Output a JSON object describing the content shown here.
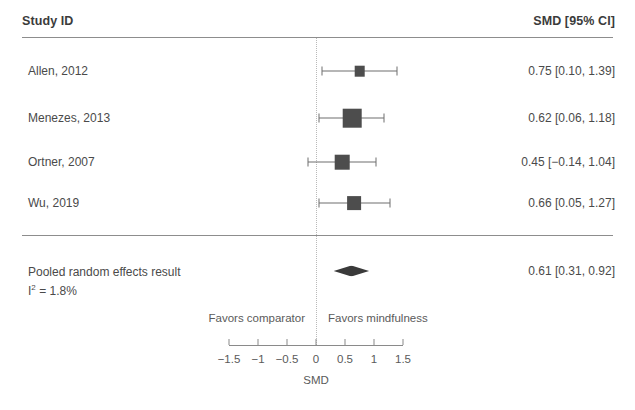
{
  "header": {
    "study_col": "Study ID",
    "effect_col": "SMD [95% CI]"
  },
  "chart_data": {
    "type": "forest",
    "title": "",
    "xlabel": "SMD",
    "ylabel": "",
    "xlim": [
      -1.75,
      1.75
    ],
    "xticks": [
      -1.5,
      -1,
      -0.5,
      0,
      0.5,
      1,
      1.5
    ],
    "xticklabels": [
      "−1.5",
      "−1",
      "−0.5",
      "0",
      "0.5",
      "1",
      "1.5"
    ],
    "reference_line": 0,
    "grid": false,
    "effect_measure": "SMD",
    "ci_level": "95%",
    "annotations": {
      "left": "Favors comparator",
      "right": "Favors mindfulness"
    },
    "studies": [
      {
        "label": "Allen, 2012",
        "estimate": 0.75,
        "ci_low": 0.1,
        "ci_high": 1.39,
        "text": "0.75 [0.10, 1.39]",
        "weight": 0.14
      },
      {
        "label": "Menezes, 2013",
        "estimate": 0.62,
        "ci_low": 0.06,
        "ci_high": 1.18,
        "text": "0.62 [0.06, 1.18]",
        "weight": 0.34
      },
      {
        "label": "Ortner, 2007",
        "estimate": 0.45,
        "ci_low": -0.14,
        "ci_high": 1.04,
        "text": "0.45 [−0.14, 1.04]",
        "weight": 0.24
      },
      {
        "label": "Wu, 2019",
        "estimate": 0.66,
        "ci_low": 0.05,
        "ci_high": 1.27,
        "text": "0.66 [0.05, 1.27]",
        "weight": 0.22
      }
    ],
    "pooled": {
      "label": "Pooled random effects result",
      "heterogeneity_prefix": "I",
      "heterogeneity_sup": "2",
      "heterogeneity_value": " = 1.8%",
      "heterogeneity_text": "I² = 1.8%",
      "estimate": 0.61,
      "ci_low": 0.31,
      "ci_high": 0.92,
      "text": "0.61 [0.31, 0.92]",
      "model": "random effects"
    }
  },
  "colors": {
    "marker": "#4d4d4d",
    "diamond": "#3a3a3a",
    "line": "#6e6e6e",
    "axis": "#8a8a8a",
    "text": "#4a4a4a",
    "reference": "#b9b9b9"
  }
}
